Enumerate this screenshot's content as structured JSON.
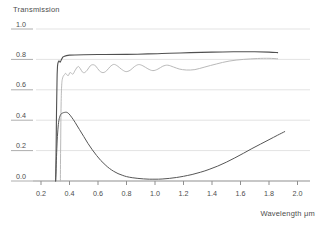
{
  "chart_data": {
    "type": "line",
    "title": "",
    "ylabel": "Transmission",
    "xlabel": "Wavelength μm",
    "xlim": [
      0.2,
      2.0
    ],
    "ylim": [
      0.0,
      1.0
    ],
    "x_ticks": [
      0.2,
      0.4,
      0.6,
      0.8,
      1.0,
      1.2,
      1.4,
      1.6,
      1.8,
      2.0
    ],
    "y_ticks": [
      0.0,
      0.2,
      0.4,
      0.6,
      0.8,
      1.0
    ],
    "grid": true,
    "legend": "none",
    "series": [
      {
        "name": "fringed-transmission",
        "color": "#b9b9b9",
        "width": 1,
        "points": [
          [
            0.336,
            0.0
          ],
          [
            0.338,
            0.25
          ],
          [
            0.341,
            0.5
          ],
          [
            0.345,
            0.63
          ],
          [
            0.35,
            0.672
          ],
          [
            0.357,
            0.69
          ],
          [
            0.365,
            0.7
          ],
          [
            0.373,
            0.708
          ],
          [
            0.382,
            0.698
          ],
          [
            0.392,
            0.694
          ],
          [
            0.403,
            0.713
          ],
          [
            0.414,
            0.708
          ],
          [
            0.425,
            0.704
          ],
          [
            0.44,
            0.729
          ],
          [
            0.46,
            0.753
          ],
          [
            0.475,
            0.74
          ],
          [
            0.49,
            0.718
          ],
          [
            0.505,
            0.713
          ],
          [
            0.525,
            0.73
          ],
          [
            0.545,
            0.757
          ],
          [
            0.565,
            0.765
          ],
          [
            0.585,
            0.755
          ],
          [
            0.61,
            0.725
          ],
          [
            0.635,
            0.713
          ],
          [
            0.66,
            0.725
          ],
          [
            0.685,
            0.752
          ],
          [
            0.71,
            0.767
          ],
          [
            0.735,
            0.758
          ],
          [
            0.765,
            0.735
          ],
          [
            0.795,
            0.72
          ],
          [
            0.825,
            0.728
          ],
          [
            0.855,
            0.752
          ],
          [
            0.885,
            0.766
          ],
          [
            0.915,
            0.758
          ],
          [
            0.95,
            0.738
          ],
          [
            0.985,
            0.726
          ],
          [
            1.02,
            0.736
          ],
          [
            1.055,
            0.755
          ],
          [
            1.09,
            0.762
          ],
          [
            1.13,
            0.75
          ],
          [
            1.17,
            0.737
          ],
          [
            1.22,
            0.73
          ],
          [
            1.28,
            0.733
          ],
          [
            1.35,
            0.75
          ],
          [
            1.43,
            0.77
          ],
          [
            1.52,
            0.789
          ],
          [
            1.62,
            0.8
          ],
          [
            1.72,
            0.806
          ],
          [
            1.8,
            0.807
          ],
          [
            1.86,
            0.804
          ]
        ]
      },
      {
        "name": "smooth-high-transmission",
        "color": "#505050",
        "width": 1.1,
        "points": [
          [
            0.303,
            0.0
          ],
          [
            0.306,
            0.2
          ],
          [
            0.309,
            0.45
          ],
          [
            0.312,
            0.65
          ],
          [
            0.316,
            0.755
          ],
          [
            0.322,
            0.785
          ],
          [
            0.33,
            0.788
          ],
          [
            0.335,
            0.782
          ],
          [
            0.34,
            0.793
          ],
          [
            0.35,
            0.81
          ],
          [
            0.36,
            0.82
          ],
          [
            0.4,
            0.828
          ],
          [
            0.5,
            0.831
          ],
          [
            0.65,
            0.832
          ],
          [
            0.8,
            0.833
          ],
          [
            0.95,
            0.836
          ],
          [
            1.1,
            0.84
          ],
          [
            1.25,
            0.845
          ],
          [
            1.4,
            0.848
          ],
          [
            1.55,
            0.85
          ],
          [
            1.7,
            0.85
          ],
          [
            1.8,
            0.848
          ],
          [
            1.86,
            0.845
          ]
        ]
      },
      {
        "name": "bell-absorption-curve",
        "color": "#565656",
        "width": 1,
        "points": [
          [
            0.302,
            0.0
          ],
          [
            0.305,
            0.06
          ],
          [
            0.309,
            0.16
          ],
          [
            0.314,
            0.27
          ],
          [
            0.32,
            0.355
          ],
          [
            0.328,
            0.41
          ],
          [
            0.338,
            0.437
          ],
          [
            0.35,
            0.447
          ],
          [
            0.365,
            0.451
          ],
          [
            0.38,
            0.452
          ],
          [
            0.395,
            0.443
          ],
          [
            0.415,
            0.42
          ],
          [
            0.44,
            0.385
          ],
          [
            0.47,
            0.338
          ],
          [
            0.5,
            0.292
          ],
          [
            0.53,
            0.247
          ],
          [
            0.56,
            0.205
          ],
          [
            0.59,
            0.168
          ],
          [
            0.62,
            0.135
          ],
          [
            0.65,
            0.107
          ],
          [
            0.68,
            0.083
          ],
          [
            0.71,
            0.064
          ],
          [
            0.74,
            0.049
          ],
          [
            0.77,
            0.038
          ],
          [
            0.8,
            0.029
          ],
          [
            0.84,
            0.022
          ],
          [
            0.88,
            0.017
          ],
          [
            0.92,
            0.014
          ],
          [
            0.96,
            0.012
          ],
          [
            1.0,
            0.012
          ],
          [
            1.05,
            0.013
          ],
          [
            1.1,
            0.017
          ],
          [
            1.15,
            0.023
          ],
          [
            1.2,
            0.031
          ],
          [
            1.26,
            0.043
          ],
          [
            1.32,
            0.058
          ],
          [
            1.38,
            0.076
          ],
          [
            1.44,
            0.098
          ],
          [
            1.5,
            0.124
          ],
          [
            1.56,
            0.152
          ],
          [
            1.62,
            0.182
          ],
          [
            1.68,
            0.213
          ],
          [
            1.74,
            0.243
          ],
          [
            1.8,
            0.272
          ],
          [
            1.86,
            0.301
          ],
          [
            1.91,
            0.325
          ]
        ]
      }
    ]
  },
  "colors": {
    "background": "#ffffff",
    "grid": "#e3e3e3",
    "axis": "#8f8f8f",
    "tick_text": "#4d4d4d",
    "label_underline": "#aeaeae"
  }
}
